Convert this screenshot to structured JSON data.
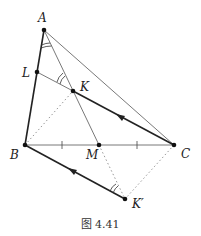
{
  "figure": {
    "caption": "图 4.41",
    "points": {
      "A": {
        "label": "A",
        "x": 44,
        "y": 30
      },
      "B": {
        "label": "B",
        "x": 25,
        "y": 145
      },
      "C": {
        "label": "C",
        "x": 174,
        "y": 145
      },
      "M": {
        "label": "M",
        "x": 99,
        "y": 145
      },
      "L": {
        "label": "L",
        "x": 37,
        "y": 72
      },
      "K": {
        "label": "K",
        "x": 73,
        "y": 91
      },
      "K_prime": {
        "label": "K′",
        "x": 125,
        "y": 199
      }
    },
    "segments": [
      {
        "from": "A",
        "to": "B",
        "style": "thick"
      },
      {
        "from": "A",
        "to": "C",
        "style": "thin"
      },
      {
        "from": "B",
        "to": "C",
        "style": "thin"
      },
      {
        "from": "A",
        "to": "M",
        "style": "thin"
      },
      {
        "from": "L",
        "to": "C",
        "style": "thin"
      },
      {
        "from": "K",
        "to": "C",
        "style": "thick-arrow"
      },
      {
        "from": "B",
        "to": "K_prime",
        "style": "thick-arrow"
      },
      {
        "from": "B",
        "to": "K",
        "style": "dotted"
      },
      {
        "from": "M",
        "to": "K_prime",
        "style": "dotted"
      },
      {
        "from": "C",
        "to": "K_prime",
        "style": "dotted"
      }
    ],
    "tick_marks": [
      "BM",
      "MC"
    ],
    "angle_marks": [
      "angle-at-A (BAM)",
      "angle-at-K (LKA)",
      "angle-at-K' (BK'M)"
    ]
  }
}
